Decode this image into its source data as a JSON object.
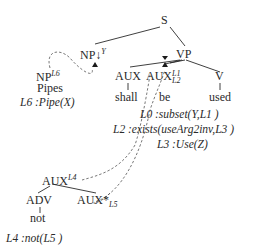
{
  "diagram": {
    "type": "tree-adjoining-grammar-derivation",
    "nodes": {
      "S": {
        "label": "S"
      },
      "NP_subst": {
        "label": "NP↓",
        "superscript": "Y"
      },
      "VP": {
        "label": "VP"
      },
      "AUX_shall": {
        "label": "AUX"
      },
      "AUX_be": {
        "label": "AUX",
        "superscript": "L1",
        "subscript": "L2"
      },
      "V": {
        "label": "V"
      },
      "NP_pipes": {
        "label": "NP",
        "superscript": "L6"
      },
      "AUX_root": {
        "label": "AUX",
        "superscript": "L4"
      },
      "ADV": {
        "label": "ADV"
      },
      "AUX_foot": {
        "label": "AUX*",
        "subscript": "L5"
      }
    },
    "words": {
      "pipes": "Pipes",
      "shall": "shall",
      "be": "be",
      "used": "used",
      "not": "not"
    },
    "semantics": {
      "pipes": {
        "label": "L6",
        "formula": ":Pipe(X)"
      },
      "main_l0": {
        "label": "L0",
        "formula": ":subset(Y,L1 )"
      },
      "main_l2": {
        "label": "L2",
        "formula": ":exists(useArg2inv,L3 )"
      },
      "main_l3": {
        "label": "L3",
        "formula": ":Use(Z)"
      },
      "not": {
        "label": "L4",
        "formula": ":not(L5 )"
      }
    },
    "colors": {
      "ink": "#2a2a2a",
      "dashed": "#555555"
    }
  }
}
